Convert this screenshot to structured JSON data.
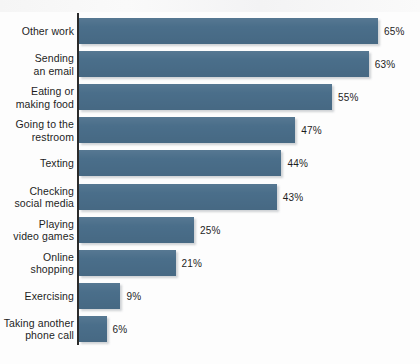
{
  "chart_data": {
    "type": "bar",
    "orientation": "horizontal",
    "title": "",
    "subtitle": "",
    "xlabel": "",
    "ylabel": "",
    "xlim": [
      0,
      65
    ],
    "grid": false,
    "legend": null,
    "value_suffix": "%",
    "bar_color": "#4a6e8a",
    "background_color": "#fdfdfd",
    "axis_color": "#2b2b2b",
    "categories": [
      "Other work",
      "Sending\nan email",
      "Eating or\nmaking food",
      "Going to the\nrestroom",
      "Texting",
      "Checking\nsocial media",
      "Playing\nvideo games",
      "Online\nshopping",
      "Exercising",
      "Taking another\nphone call"
    ],
    "values": [
      65,
      63,
      55,
      47,
      44,
      43,
      25,
      21,
      9,
      6
    ],
    "value_labels": [
      "65%",
      "63%",
      "55%",
      "47%",
      "44%",
      "43%",
      "25%",
      "21%",
      "9%",
      "6%"
    ]
  }
}
